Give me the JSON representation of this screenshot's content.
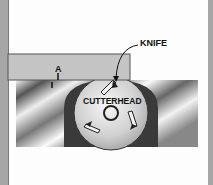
{
  "diagram": {
    "labels": {
      "knife": "KNIFE",
      "cutterhead": "CUTTERHEAD",
      "gap": "A"
    },
    "colors": {
      "board": "#c4c4c4",
      "housing": "#3a3a3a",
      "cutterhead": "#d9d9d9",
      "border": "#a6a6a6"
    }
  }
}
